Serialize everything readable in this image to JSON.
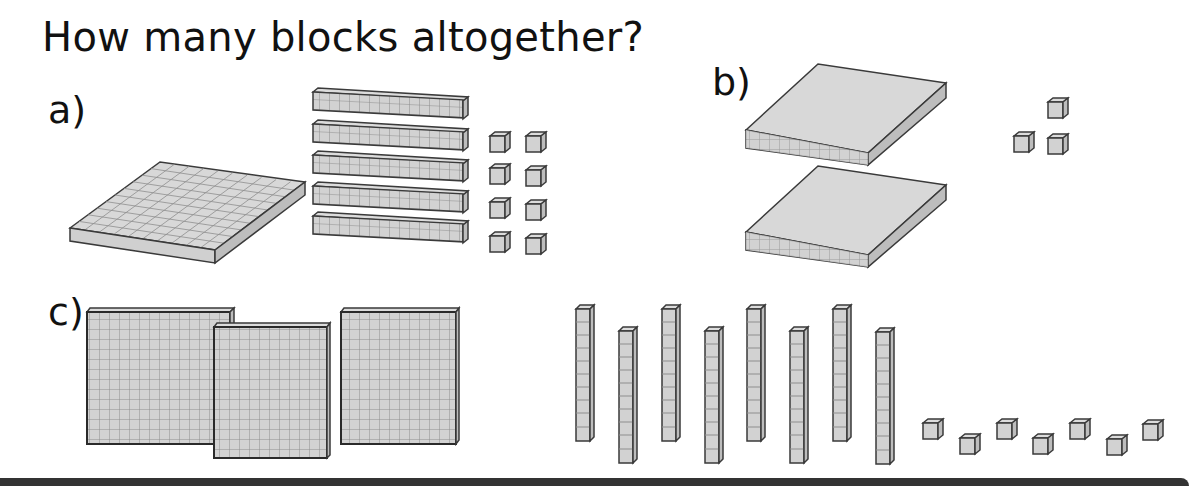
{
  "worksheet": {
    "title": "How many blocks altogether?",
    "questions": [
      {
        "label": "a)",
        "hundreds": 1,
        "tens": 5,
        "ones": 8
      },
      {
        "label": "b)",
        "hundreds": 2,
        "tens": 0,
        "ones": 3
      },
      {
        "label": "c)",
        "hundreds": 3,
        "tens": 8,
        "ones": 7
      }
    ]
  },
  "colors": {
    "block_fill": "#d2d2d2",
    "block_side": "#bdbdbd",
    "block_edge": "#3a3a3a",
    "grid_line": "#8e8e8e"
  }
}
